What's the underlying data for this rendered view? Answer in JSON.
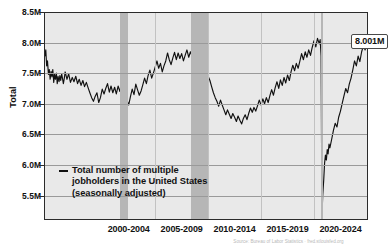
{
  "chart_data": {
    "type": "line",
    "title": "",
    "subtitle": "",
    "xlabel": "",
    "ylabel": "Total",
    "legend_position": "inside-bottom-left",
    "grid": true,
    "ylim": [
      5100000,
      8500000
    ],
    "xlim": [
      1994.0,
      2024.6
    ],
    "ytick_labels": [
      "8.5M",
      "8.0M",
      "7.5M",
      "7.0M",
      "6.5M",
      "6.0M",
      "5.5M"
    ],
    "ytick_values": [
      8500000,
      8000000,
      7500000,
      7000000,
      6500000,
      6000000,
      5500000
    ],
    "xtick_labels": [
      "2000-2004",
      "2005-2009",
      "2010-2014",
      "2015-2019",
      "2020-2024"
    ],
    "xtick_values": [
      2002,
      2007,
      2012,
      2017,
      2022
    ],
    "series": [
      {
        "name": "Total number of multiple jobholders in the United States (seasonally adjusted)",
        "color": "#111111",
        "x": [
          1994.0,
          1994.08,
          1994.17,
          1994.25,
          1994.33,
          1994.42,
          1994.5,
          1994.58,
          1994.67,
          1994.75,
          1994.83,
          1994.92,
          1995.0,
          1995.08,
          1995.17,
          1995.25,
          1995.33,
          1995.42,
          1995.5,
          1995.58,
          1995.67,
          1995.75,
          1995.83,
          1995.92,
          1996.0,
          1996.17,
          1996.33,
          1996.5,
          1996.67,
          1996.83,
          1997.0,
          1997.17,
          1997.33,
          1997.5,
          1997.67,
          1997.83,
          1998.0,
          1998.17,
          1998.33,
          1998.5,
          1998.67,
          1998.83,
          1999.0,
          1999.17,
          1999.33,
          1999.5,
          1999.67,
          1999.83,
          2000.0,
          2000.17,
          2000.33,
          2000.5,
          2000.67,
          2000.83,
          2001.0,
          2001.17,
          2001.33,
          2001.5,
          2001.67,
          2001.83,
          2002.0,
          2002.17,
          2002.33,
          2002.5,
          2002.67,
          2002.83,
          2003.0,
          2003.17,
          2003.33,
          2003.5,
          2003.67,
          2003.83,
          2004.0,
          2004.17,
          2004.33,
          2004.5,
          2004.67,
          2004.83,
          2005.0,
          2005.17,
          2005.33,
          2005.5,
          2005.67,
          2005.83,
          2006.0,
          2006.17,
          2006.33,
          2006.5,
          2006.67,
          2006.83,
          2007.0,
          2007.17,
          2007.33,
          2007.5,
          2007.67,
          2007.83,
          2008.0,
          2008.17,
          2008.33,
          2008.5,
          2008.67,
          2008.83,
          2009.0,
          2009.17,
          2009.33,
          2009.5,
          2009.67,
          2009.83,
          2010.0,
          2010.17,
          2010.33,
          2010.5,
          2010.67,
          2010.83,
          2011.0,
          2011.17,
          2011.33,
          2011.5,
          2011.67,
          2011.83,
          2012.0,
          2012.17,
          2012.33,
          2012.5,
          2012.67,
          2012.83,
          2013.0,
          2013.17,
          2013.33,
          2013.5,
          2013.67,
          2013.83,
          2014.0,
          2014.17,
          2014.33,
          2014.5,
          2014.67,
          2014.83,
          2015.0,
          2015.17,
          2015.33,
          2015.5,
          2015.67,
          2015.83,
          2016.0,
          2016.17,
          2016.33,
          2016.5,
          2016.67,
          2016.83,
          2017.0,
          2017.17,
          2017.33,
          2017.5,
          2017.67,
          2017.83,
          2018.0,
          2018.17,
          2018.33,
          2018.5,
          2018.67,
          2018.83,
          2019.0,
          2019.17,
          2019.33,
          2019.5,
          2019.67,
          2019.83,
          2020.0,
          2020.08,
          2020.17,
          2020.25,
          2020.33,
          2020.42,
          2020.5,
          2020.58,
          2020.67,
          2020.75,
          2020.83,
          2020.92,
          2021.0,
          2021.17,
          2021.33,
          2021.5,
          2021.67,
          2021.83,
          2022.0,
          2022.17,
          2022.33,
          2022.5,
          2022.67,
          2022.83,
          2023.0,
          2023.17,
          2023.33,
          2023.5,
          2023.67,
          2023.83,
          2024.0,
          2024.17,
          2024.33,
          2024.5
        ],
        "y": [
          7950000,
          7780000,
          7880000,
          7620000,
          7700000,
          7480000,
          7560000,
          7400000,
          7530000,
          7440000,
          7560000,
          7350000,
          7480000,
          7400000,
          7500000,
          7330000,
          7450000,
          7360000,
          7460000,
          7380000,
          7490000,
          7410000,
          7330000,
          7420000,
          7520000,
          7400000,
          7490000,
          7350000,
          7430000,
          7360000,
          7450000,
          7330000,
          7400000,
          7300000,
          7380000,
          7280000,
          7350000,
          7260000,
          7180000,
          7100000,
          7040000,
          7120000,
          7180000,
          7020000,
          7100000,
          7240000,
          7160000,
          7250000,
          7330000,
          7190000,
          7290000,
          7180000,
          7270000,
          7160000,
          7290000,
          7200000,
          7350000,
          7250000,
          7150000,
          7060000,
          6980000,
          7120000,
          7240000,
          7150000,
          7320000,
          7230000,
          7140000,
          7210000,
          7310000,
          7420000,
          7330000,
          7460000,
          7550000,
          7420000,
          7500000,
          7600000,
          7700000,
          7580000,
          7660000,
          7520000,
          7620000,
          7700000,
          7830000,
          7720000,
          7640000,
          7750000,
          7840000,
          7720000,
          7830000,
          7740000,
          7820000,
          7700000,
          7790000,
          7880000,
          7760000,
          7850000,
          7770000,
          7880000,
          7790000,
          7700000,
          7600000,
          8060000,
          7820000,
          7640000,
          7560000,
          7450000,
          7380000,
          7280000,
          7180000,
          7100000,
          7040000,
          6960000,
          7060000,
          6980000,
          6900000,
          6820000,
          6900000,
          6830000,
          6760000,
          6840000,
          6780000,
          6710000,
          6800000,
          6730000,
          6670000,
          6760000,
          6820000,
          6740000,
          6840000,
          6930000,
          6860000,
          6940000,
          6880000,
          6970000,
          7060000,
          6980000,
          7080000,
          7000000,
          7100000,
          7020000,
          7130000,
          7230000,
          7140000,
          7260000,
          7360000,
          7250000,
          7390000,
          7300000,
          7430000,
          7340000,
          7470000,
          7380000,
          7520000,
          7630000,
          7540000,
          7660000,
          7580000,
          7700000,
          7820000,
          7720000,
          7850000,
          7760000,
          7880000,
          7790000,
          7920000,
          8030000,
          7930000,
          8070000,
          7980000,
          8050000,
          7780000,
          5180000,
          5520000,
          5760000,
          6030000,
          6160000,
          6080000,
          6250000,
          6180000,
          6340000,
          6280000,
          6420000,
          6560000,
          6680000,
          6620000,
          6780000,
          6880000,
          7010000,
          7130000,
          7250000,
          7180000,
          7320000,
          7420000,
          7560000,
          7700000,
          7620000,
          7780000,
          7690000,
          7850000,
          7950000,
          7880000,
          8001000
        ]
      }
    ],
    "recession_bands": [
      {
        "start": 2001.17,
        "end": 2001.92,
        "label": "2001 recession"
      },
      {
        "start": 2007.92,
        "end": 2009.5,
        "label": "2008-09 recession"
      },
      {
        "start": 2020.17,
        "end": 2020.33,
        "label": "2020 recession"
      }
    ],
    "annotations": [
      {
        "name": "last-value",
        "text": "8.001M",
        "x": 2024.5,
        "y": 8001000
      }
    ]
  },
  "legend": {
    "dash_name": "line-dash-marker",
    "line1": "— Total number of multiple",
    "text": "Total number of multiple\njobholders in the United States\n(seasonally adjusted)"
  },
  "footer": {
    "note": "Source: Bureau of Labor Statistics · fred.stlouisfed.org"
  },
  "colors": {
    "line": "#111111",
    "plot_background": "#e9e9e9",
    "recession_band": "#b6b6b6",
    "gridline": "#9a9a9a",
    "axis": "#2b2b2b",
    "text": "#111111"
  }
}
